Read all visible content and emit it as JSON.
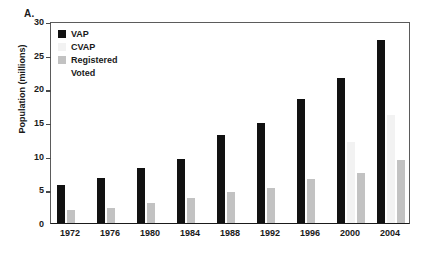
{
  "panel": {
    "label": "A."
  },
  "chart_data": {
    "type": "bar",
    "title": "",
    "xlabel": "",
    "ylabel": "Population (millions)",
    "ylim": [
      0,
      30
    ],
    "ytick_values": [
      30,
      25,
      20,
      15,
      10,
      5,
      0
    ],
    "ytick_labels": [
      "30",
      "25",
      "20",
      "15",
      "10",
      "5",
      "0"
    ],
    "grid": false,
    "legend_position": "top-left",
    "categories": [
      "1972",
      "1976",
      "1980",
      "1984",
      "1988",
      "1992",
      "1996",
      "2000",
      "2004"
    ],
    "series": [
      {
        "name": "VAP",
        "color": "#111111",
        "values": [
          5.7,
          6.7,
          8.2,
          9.5,
          13.0,
          14.8,
          18.4,
          21.5,
          27.2
        ]
      },
      {
        "name": "CVAP",
        "color": "#f2f2f2",
        "values": [
          null,
          null,
          null,
          null,
          null,
          null,
          null,
          12.0,
          16.1
        ]
      },
      {
        "name": "Registered",
        "color": "#c2c2c2",
        "values": [
          2.0,
          2.3,
          2.9,
          3.7,
          4.6,
          5.2,
          6.6,
          7.5,
          9.4
        ]
      },
      {
        "name": "Voted",
        "color": "#ffffff",
        "values": [
          null,
          null,
          null,
          null,
          null,
          null,
          null,
          null,
          null
        ]
      }
    ]
  },
  "legend": {
    "items": [
      {
        "label": "VAP",
        "color": "#111111"
      },
      {
        "label": "CVAP",
        "color": "#f2f2f2"
      },
      {
        "label": "Registered",
        "color": "#c2c2c2"
      },
      {
        "label": "Voted",
        "color": "#ffffff"
      }
    ]
  }
}
